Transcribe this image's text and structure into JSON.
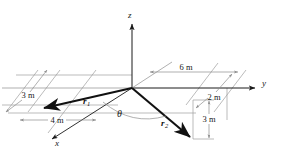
{
  "figure": {
    "axes": [
      {
        "name": "z",
        "label": "z"
      },
      {
        "name": "y",
        "label": "y"
      },
      {
        "name": "x",
        "label": "x"
      }
    ],
    "vectors": [
      {
        "name": "r1",
        "base": "r",
        "subscript": "1"
      },
      {
        "name": "r2",
        "base": "r",
        "subscript": "2"
      }
    ],
    "angle": {
      "label": "θ"
    },
    "dimensions": [
      {
        "name": "dim-6m",
        "label": "6 m"
      },
      {
        "name": "dim-3m-left",
        "label": "3 m"
      },
      {
        "name": "dim-4m",
        "label": "4 m"
      },
      {
        "name": "dim-2m",
        "label": "2 m"
      },
      {
        "name": "dim-3m-right",
        "label": "3 m"
      }
    ],
    "colors": {
      "stroke_dark": "#1a1a1a",
      "stroke_grey": "#9a9a9a",
      "background": "#ffffff"
    }
  }
}
